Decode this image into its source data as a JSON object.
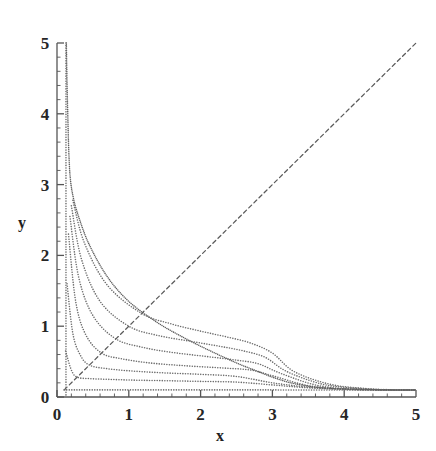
{
  "figure": {
    "background": "#ffffff",
    "ink": "#4a4a4a",
    "axis_color": "#555555",
    "label_color": "#262626"
  },
  "chart_data": {
    "type": "line",
    "title": "",
    "subtitle": "",
    "xlabel": "x",
    "ylabel": "y",
    "xlim": [
      0,
      5
    ],
    "ylim": [
      0,
      5
    ],
    "xticks": [
      0,
      1,
      2,
      3,
      4,
      5
    ],
    "yticks": [
      0,
      1,
      2,
      3,
      4,
      5
    ],
    "xticklabels": [
      "0",
      "1",
      "2",
      "3",
      "4",
      "5"
    ],
    "yticklabels": [
      "0",
      "1",
      "2",
      "3",
      "4",
      "5"
    ],
    "minor_ticks_per_interval": 4,
    "grid": false,
    "legend": null,
    "legend_position": "none",
    "linestyle": "dotted",
    "annotations": [],
    "series": [
      {
        "name": "diagonal y = x",
        "style": "dashed",
        "color": "#5a5a5a",
        "x": [
          0.12,
          0.5,
          1.0,
          1.5,
          2.0,
          2.5,
          3.0,
          3.5,
          4.0,
          4.5,
          5.0
        ],
        "values": [
          0.12,
          0.5,
          1.0,
          1.5,
          2.0,
          2.5,
          3.0,
          3.5,
          4.0,
          4.5,
          5.0
        ]
      },
      {
        "name": "trajectory c = 0.10",
        "style": "dotted",
        "color": "#6b6b6b",
        "min_point": [
          0.1,
          0.1
        ],
        "x": [
          0.1,
          0.3,
          0.6,
          1.0,
          1.5,
          2.0,
          2.5,
          3.0,
          3.5,
          4.0,
          4.5,
          5.0
        ],
        "values": [
          0.1,
          0.1,
          0.1,
          0.1,
          0.1,
          0.1,
          0.1,
          0.1,
          0.099,
          0.099,
          0.098,
          0.098
        ]
      },
      {
        "name": "trajectory c = 0.28",
        "style": "dotted",
        "color": "#6b6b6b",
        "min_point": [
          0.28,
          0.28
        ],
        "x": [
          0.12,
          0.2,
          0.28,
          0.45,
          0.7,
          1.0,
          1.5,
          2.0,
          2.5,
          3.0,
          3.5,
          4.0,
          4.5,
          5.0
        ],
        "values": [
          0.65,
          0.38,
          0.28,
          0.26,
          0.25,
          0.24,
          0.23,
          0.22,
          0.21,
          0.17,
          0.13,
          0.11,
          0.1,
          0.1
        ]
      },
      {
        "name": "trajectory c = 0.45",
        "style": "dotted",
        "color": "#6b6b6b",
        "min_point": [
          0.45,
          0.45
        ],
        "x": [
          0.14,
          0.22,
          0.32,
          0.45,
          0.7,
          1.0,
          1.5,
          2.0,
          2.5,
          3.0,
          3.5,
          4.0,
          4.5,
          5.0
        ],
        "values": [
          1.6,
          0.9,
          0.6,
          0.45,
          0.4,
          0.37,
          0.34,
          0.32,
          0.29,
          0.2,
          0.14,
          0.11,
          0.1,
          0.1
        ]
      },
      {
        "name": "trajectory c = 0.62",
        "style": "dotted",
        "color": "#6b6b6b",
        "min_point": [
          0.62,
          0.62
        ],
        "x": [
          0.16,
          0.26,
          0.4,
          0.62,
          0.9,
          1.3,
          1.8,
          2.3,
          2.7,
          3.0,
          3.5,
          4.0,
          4.5,
          5.0
        ],
        "values": [
          2.3,
          1.35,
          0.88,
          0.62,
          0.54,
          0.48,
          0.44,
          0.41,
          0.38,
          0.3,
          0.16,
          0.11,
          0.1,
          0.1
        ]
      },
      {
        "name": "trajectory c = 0.82",
        "style": "dotted",
        "color": "#6b6b6b",
        "min_point": [
          0.82,
          0.82
        ],
        "x": [
          0.18,
          0.3,
          0.5,
          0.82,
          1.2,
          1.6,
          2.1,
          2.5,
          2.8,
          3.1,
          3.6,
          4.1,
          4.6,
          5.0
        ],
        "values": [
          2.55,
          1.7,
          1.15,
          0.82,
          0.7,
          0.63,
          0.57,
          0.52,
          0.47,
          0.34,
          0.17,
          0.11,
          0.1,
          0.1
        ]
      },
      {
        "name": "trajectory c = 1.00",
        "style": "dotted",
        "color": "#6b6b6b",
        "min_point": [
          1.0,
          1.0
        ],
        "x": [
          0.2,
          0.34,
          0.6,
          1.0,
          1.4,
          1.9,
          2.3,
          2.6,
          2.9,
          3.2,
          3.7,
          4.2,
          4.6,
          5.0
        ],
        "values": [
          2.7,
          1.95,
          1.35,
          1.0,
          0.87,
          0.78,
          0.71,
          0.65,
          0.56,
          0.36,
          0.18,
          0.12,
          0.1,
          0.1
        ]
      },
      {
        "name": "trajectory c = 1.18",
        "style": "dotted",
        "color": "#6b6b6b",
        "min_point": [
          1.18,
          1.18
        ],
        "x": [
          0.22,
          0.38,
          0.7,
          1.18,
          1.6,
          2.0,
          2.4,
          2.7,
          3.0,
          3.3,
          3.8,
          4.3,
          4.7,
          5.0
        ],
        "values": [
          2.78,
          2.18,
          1.58,
          1.18,
          1.03,
          0.93,
          0.84,
          0.76,
          0.62,
          0.36,
          0.18,
          0.12,
          0.1,
          0.1
        ]
      },
      {
        "name": "envelope / separatrix",
        "style": "dotted-dense",
        "color": "#5f5f5f",
        "min_point": null,
        "x": [
          0.13,
          0.14,
          0.15,
          0.16,
          0.18,
          0.22,
          0.3,
          0.45,
          0.7,
          1.0,
          1.4,
          1.8,
          2.2,
          2.55,
          2.8,
          3.0,
          3.3,
          3.7,
          4.2,
          4.7,
          5.0
        ],
        "values": [
          5.0,
          4.4,
          4.0,
          3.6,
          3.15,
          2.85,
          2.55,
          2.15,
          1.7,
          1.35,
          1.05,
          0.82,
          0.62,
          0.46,
          0.36,
          0.28,
          0.19,
          0.13,
          0.11,
          0.1,
          0.1
        ]
      },
      {
        "name": "vertical asymptote branch",
        "style": "dotted",
        "color": "#6b6b6b",
        "x": [
          0.125,
          0.125,
          0.125,
          0.125,
          0.125,
          0.125
        ],
        "values": [
          5.0,
          4.0,
          3.0,
          2.0,
          1.0,
          0.0
        ]
      }
    ]
  }
}
